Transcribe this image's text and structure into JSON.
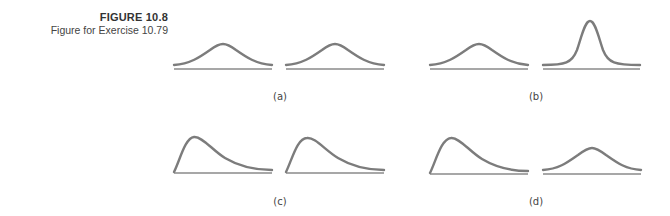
{
  "figure": {
    "number": "FIGURE 10.8",
    "caption": "Figure for Exercise 10.79"
  },
  "panels": [
    {
      "label": "(a)",
      "left_shape": "symmetric-normal-wide",
      "right_shape": "symmetric-normal-wide"
    },
    {
      "label": "(b)",
      "left_shape": "symmetric-normal-wide",
      "right_shape": "symmetric-normal-narrow-tall"
    },
    {
      "label": "(c)",
      "left_shape": "right-skewed",
      "right_shape": "right-skewed"
    },
    {
      "label": "(d)",
      "left_shape": "right-skewed",
      "right_shape": "symmetric-normal-wide"
    }
  ],
  "colors": {
    "curve": "#7c7c7c",
    "axis": "#8a8a8a",
    "text": "#444444"
  }
}
